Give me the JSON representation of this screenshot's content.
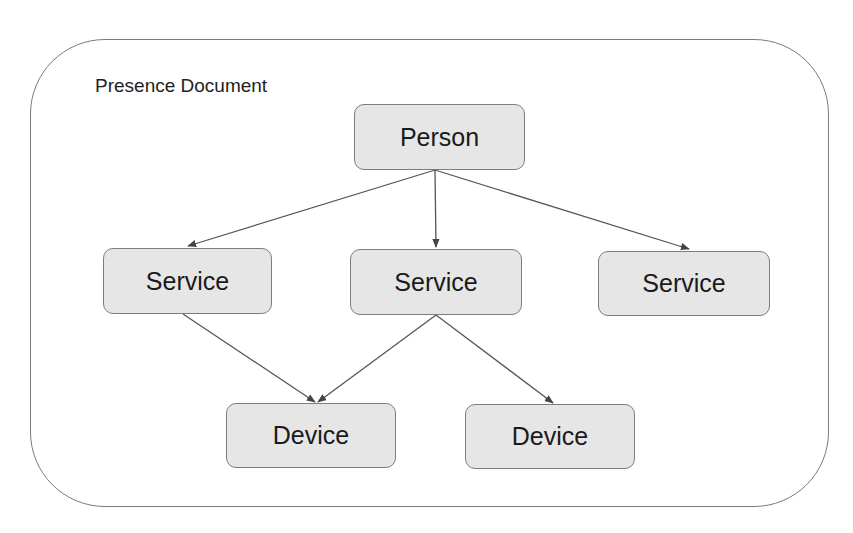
{
  "diagram": {
    "container": {
      "title": "Presence Document"
    },
    "nodes": [
      {
        "id": "person",
        "label": "Person",
        "x": 354,
        "y": 104,
        "w": 171,
        "h": 66
      },
      {
        "id": "service-1",
        "label": "Service",
        "x": 103,
        "y": 248,
        "w": 169,
        "h": 66
      },
      {
        "id": "service-2",
        "label": "Service",
        "x": 350,
        "y": 249,
        "w": 172,
        "h": 66
      },
      {
        "id": "service-3",
        "label": "Service",
        "x": 598,
        "y": 251,
        "w": 172,
        "h": 65
      },
      {
        "id": "device-1",
        "label": "Device",
        "x": 226,
        "y": 403,
        "w": 170,
        "h": 65
      },
      {
        "id": "device-2",
        "label": "Device",
        "x": 465,
        "y": 404,
        "w": 170,
        "h": 65
      }
    ],
    "edges": [
      {
        "from": "person",
        "to": "service-1",
        "x1": 435,
        "y1": 170,
        "x2": 188,
        "y2": 246
      },
      {
        "from": "person",
        "to": "service-2",
        "x1": 435,
        "y1": 170,
        "x2": 436,
        "y2": 247
      },
      {
        "from": "person",
        "to": "service-3",
        "x1": 435,
        "y1": 170,
        "x2": 689,
        "y2": 249
      },
      {
        "from": "service-1",
        "to": "device-1",
        "x1": 183,
        "y1": 314,
        "x2": 315,
        "y2": 402
      },
      {
        "from": "service-2",
        "to": "device-1",
        "x1": 436,
        "y1": 315,
        "x2": 318,
        "y2": 402
      },
      {
        "from": "service-2",
        "to": "device-2",
        "x1": 436,
        "y1": 315,
        "x2": 553,
        "y2": 403
      }
    ],
    "colors": {
      "node_fill": "#e6e6e6",
      "node_border": "#7d7d7d",
      "edge": "#555555",
      "container_border": "#7a7a7a",
      "text": "#1a1a1a"
    }
  }
}
